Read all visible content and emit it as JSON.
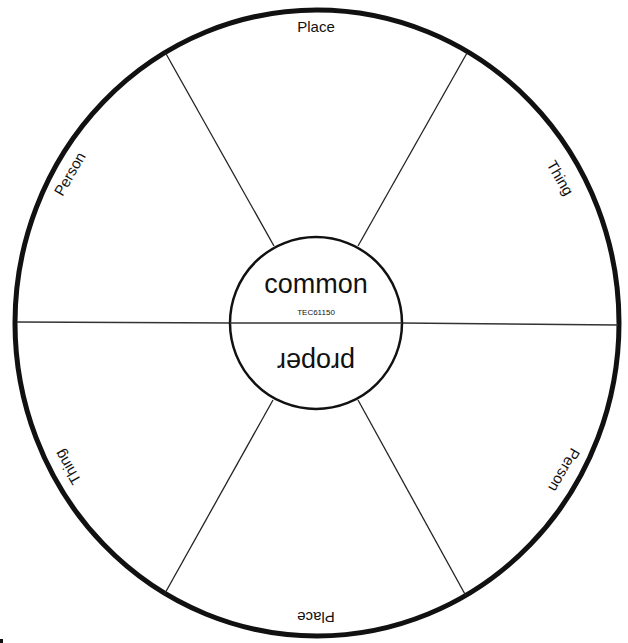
{
  "diagram": {
    "type": "noun-sorting-wheel",
    "center": {
      "top_label": "common",
      "bottom_label": "proper",
      "code": "TEC61150"
    },
    "outer_labels": [
      {
        "id": "top",
        "text": "Place"
      },
      {
        "id": "upper-right",
        "text": "Thing"
      },
      {
        "id": "lower-right",
        "text": "Person"
      },
      {
        "id": "bottom",
        "text": "Place"
      },
      {
        "id": "lower-left",
        "text": "Thing"
      },
      {
        "id": "upper-left",
        "text": "Person"
      }
    ],
    "colors": {
      "stroke": "#111111",
      "background": "#ffffff"
    }
  }
}
